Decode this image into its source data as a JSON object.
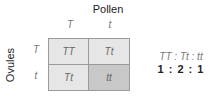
{
  "title": "Pollen",
  "pollen_alleles": [
    "T",
    "t"
  ],
  "side_label": "Ovules",
  "ovule_alleles": [
    "T",
    "t"
  ],
  "cells": [
    "TT",
    "Tt",
    "Tt",
    "tt"
  ],
  "ratio": {
    "genotypes": "TT : Tt : tt",
    "numbers": "1 : 2 : 1"
  },
  "colors": {
    "light_cell": "#e6e6e6",
    "dark_cell": "#c8c8c8"
  }
}
